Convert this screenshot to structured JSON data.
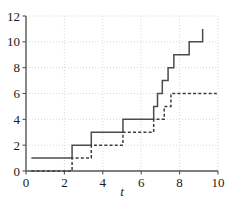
{
  "chart_data": {
    "type": "line",
    "title": "",
    "subtitle": "",
    "xlabel": "t",
    "ylabel": "",
    "xlim": [
      0,
      10
    ],
    "ylim": [
      0,
      12
    ],
    "xticks": [
      0,
      2,
      4,
      6,
      8,
      10
    ],
    "yticks": [
      0,
      2,
      4,
      6,
      8,
      10,
      12
    ],
    "xtick_labels": [
      "0",
      "2",
      "4",
      "6",
      "8",
      "10"
    ],
    "ytick_labels": [
      "0",
      "2",
      "4",
      "6",
      "8",
      "10",
      "12"
    ],
    "grid": true,
    "grid_style": "dotted",
    "legend": false,
    "legend_position": "none",
    "note": "Two right-continuous step (counting-process) functions; values increase by unit jumps at event times.",
    "series": [
      {
        "name": "solid-step",
        "style": "solid",
        "color": "#4c4c4c",
        "interpolation": "step-post",
        "x_start": 0.28,
        "x_end": 9.2,
        "points": [
          {
            "t": 0.28,
            "value": 1
          },
          {
            "t": 2.4,
            "value": 2
          },
          {
            "t": 3.4,
            "value": 3
          },
          {
            "t": 5.05,
            "value": 4
          },
          {
            "t": 6.65,
            "value": 5
          },
          {
            "t": 6.85,
            "value": 6
          },
          {
            "t": 7.1,
            "value": 7
          },
          {
            "t": 7.4,
            "value": 8
          },
          {
            "t": 7.7,
            "value": 9
          },
          {
            "t": 8.5,
            "value": 10
          },
          {
            "t": 9.2,
            "value": 11
          }
        ]
      },
      {
        "name": "dashed-step",
        "style": "dashed",
        "color": "#3d3d3d",
        "interpolation": "step-post",
        "x_start": 0.28,
        "x_end": 10.0,
        "points": [
          {
            "t": 0.28,
            "value": 0
          },
          {
            "t": 2.4,
            "value": 1
          },
          {
            "t": 3.4,
            "value": 2
          },
          {
            "t": 5.05,
            "value": 3
          },
          {
            "t": 6.65,
            "value": 4
          },
          {
            "t": 7.2,
            "value": 5
          },
          {
            "t": 7.55,
            "value": 6
          },
          {
            "t": 10.0,
            "value": 6
          }
        ]
      }
    ]
  },
  "axes": {
    "x_axis_name": "x-axis",
    "y_axis_name": "y-axis"
  }
}
